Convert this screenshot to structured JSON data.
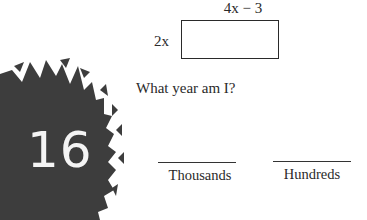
{
  "badge": {
    "number": "16",
    "fill_color": "#3d3d3d",
    "text_color": "#f4f4f4"
  },
  "diagram": {
    "top_dimension": "4x − 3",
    "left_dimension": "2x",
    "shape": "rectangle"
  },
  "question": "What year am I?",
  "blanks": [
    {
      "label": "Thousands"
    },
    {
      "label": "Hundreds"
    }
  ]
}
